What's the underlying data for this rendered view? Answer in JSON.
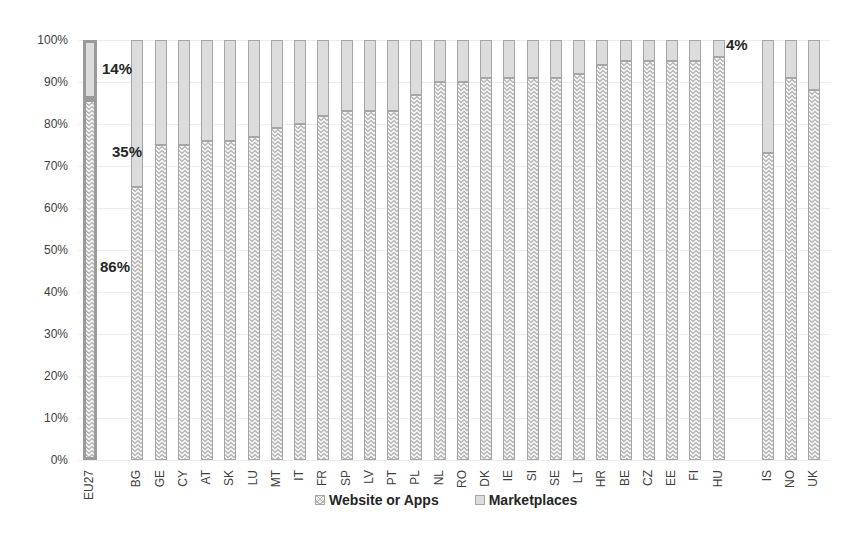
{
  "chart_data": {
    "type": "bar",
    "stacked": true,
    "percent_stacked": true,
    "title": "",
    "xlabel": "",
    "ylabel": "",
    "ylim": [
      0,
      100
    ],
    "yticks": [
      "0%",
      "10%",
      "20%",
      "30%",
      "40%",
      "50%",
      "60%",
      "70%",
      "80%",
      "90%",
      "100%"
    ],
    "grid": true,
    "legend_position": "bottom",
    "categories": [
      "EU27",
      "BG",
      "GE",
      "CY",
      "AT",
      "SK",
      "LU",
      "MT",
      "IT",
      "FR",
      "SP",
      "LV",
      "PT",
      "PL",
      "NL",
      "RO",
      "DK",
      "IE",
      "SI",
      "SE",
      "LT",
      "HR",
      "BE",
      "CZ",
      "EE",
      "FI",
      "HU",
      "IS",
      "NO",
      "UK"
    ],
    "series": [
      {
        "name": "Website or Apps",
        "values": [
          86,
          65,
          75,
          75,
          76,
          76,
          77,
          79,
          80,
          82,
          83,
          83,
          83,
          87,
          90,
          90,
          91,
          91,
          91,
          91,
          92,
          94,
          95,
          95,
          95,
          95,
          96,
          73,
          91,
          88
        ]
      },
      {
        "name": "Marketplaces",
        "values": [
          14,
          35,
          25,
          25,
          24,
          24,
          23,
          21,
          20,
          18,
          17,
          17,
          17,
          13,
          10,
          10,
          9,
          9,
          9,
          9,
          8,
          6,
          5,
          5,
          5,
          5,
          4,
          27,
          9,
          12
        ]
      }
    ],
    "annotations": [
      {
        "text": "14%",
        "target": "EU27 Marketplaces"
      },
      {
        "text": "86%",
        "target": "EU27 Website or Apps"
      },
      {
        "text": "35%",
        "target": "BG Marketplaces"
      },
      {
        "text": "4%",
        "target": "HU Marketplaces"
      }
    ],
    "x_positions": [
      90,
      137,
      161,
      184,
      207,
      230,
      254,
      277,
      300,
      323,
      347,
      370,
      393,
      416,
      440,
      463,
      486,
      509,
      533,
      556,
      579,
      602,
      626,
      649,
      672,
      695,
      719,
      768,
      791,
      814
    ]
  },
  "legend": {
    "website_label": "Website or Apps",
    "marketplaces_label": "Marketplaces"
  }
}
